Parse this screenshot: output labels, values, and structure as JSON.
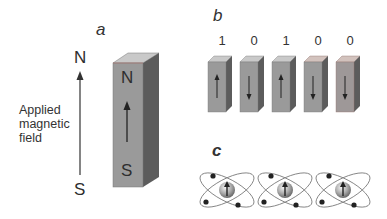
{
  "panel_a": {
    "label": "a",
    "field": {
      "north_label": "N",
      "south_label": "S",
      "caption_lines": [
        "Applied",
        "magnetic",
        "field"
      ],
      "arrow_direction": "up"
    },
    "magnet": {
      "top_pole": "N",
      "bottom_pole": "S",
      "arrow_direction": "up"
    }
  },
  "panel_b": {
    "label": "b",
    "bits": [
      {
        "value": "1",
        "arrow_direction": "up"
      },
      {
        "value": "0",
        "arrow_direction": "down"
      },
      {
        "value": "1",
        "arrow_direction": "up"
      },
      {
        "value": "0",
        "arrow_direction": "down"
      },
      {
        "value": "0",
        "arrow_direction": "down"
      }
    ]
  },
  "panel_c": {
    "label": "c",
    "atoms": [
      {
        "spin": "up"
      },
      {
        "spin": "up"
      },
      {
        "spin": "up"
      }
    ]
  },
  "colors": {
    "front_face": "#9a9a9a",
    "side_face": "#5c5c5c",
    "top_face": "#c9c9c9",
    "text": "#2e2e2e"
  }
}
